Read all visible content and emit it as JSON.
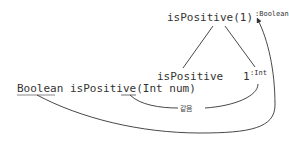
{
  "diagram": {
    "root": {
      "expr": "isPositive(1)",
      "type": ":Boolean"
    },
    "children": [
      {
        "expr": "isPositive"
      },
      {
        "expr": "1",
        "type": ":Int"
      }
    ],
    "signature": {
      "return_type": "Boolean",
      "name": " isPositive(",
      "param_type": "Int",
      "param_rest": " num)"
    },
    "edge_label": "같음"
  }
}
